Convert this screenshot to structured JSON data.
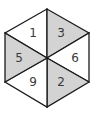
{
  "figure": {
    "shade_color": "#d3d3d3",
    "line_color": "#1a1a1a",
    "triangles": [
      {
        "id": "top-left",
        "label": "1",
        "shaded": false
      },
      {
        "id": "top-right",
        "label": "3",
        "shaded": true
      },
      {
        "id": "right",
        "label": "6",
        "shaded": false
      },
      {
        "id": "bottom-right",
        "label": "2",
        "shaded": true
      },
      {
        "id": "bottom-left",
        "label": "9",
        "shaded": false
      },
      {
        "id": "left",
        "label": "5",
        "shaded": true
      }
    ]
  }
}
